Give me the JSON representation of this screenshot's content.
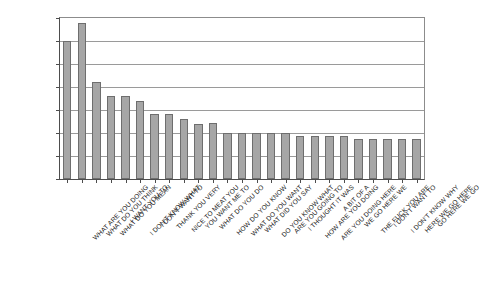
{
  "chart_data": {
    "type": "bar",
    "title": "",
    "subtitle": "",
    "xlabel": "",
    "ylabel": "",
    "ylim": [
      0,
      35
    ],
    "grid": true,
    "legend": false,
    "legend_position": "none",
    "bar_color": "#a6a6a6",
    "bar_border_color": "#6e6e6e",
    "axis_color": "#4d4d4d",
    "grid_color": "#9a9a9a",
    "ytick_labels": [
      "35",
      "30",
      "35",
      "20",
      "15",
      "10",
      "5",
      "0"
    ],
    "ytick_values": [
      35,
      30,
      25,
      20,
      15,
      10,
      5,
      0
    ],
    "categories": [
      "WHAT ARE YOU DOING",
      "WHAT DO YOU THINK",
      "WHAT DO YOU MEAN",
      "I WANT YOU TO",
      "I DON'T KNOW WHAT",
      "I DON'T WANT TO",
      "THANK YOU VERY",
      "NICE TO MEAT YOU",
      "YOU WANT ME TO",
      "WHAT DO YOU DO",
      "HOW DO YOU KNOW",
      "WHAT DO YOU WANT",
      "WHAT DID YOU SAY",
      "DO YOU KNOW WHAT",
      "ARE YOU GOING TO",
      "I THOUGHT IT WAS",
      "HOW ARE YOU DOING",
      "ARE YOU DOING HERE",
      "A BIT OF A",
      "WE GO HERE WE",
      "THE FUCK YOU ARE",
      "I DON'T WANT TO",
      "I DON'T KNOW WHY",
      "HERE WE GO HERE",
      "GO HERE WE GO"
    ],
    "values": [
      30,
      34,
      21,
      18,
      18,
      17,
      14.2,
      14.2,
      13,
      12,
      12.2,
      10,
      10,
      10,
      10,
      10,
      9.3,
      9.3,
      9.3,
      9.3,
      8.7,
      8.7,
      8.7,
      8.7,
      8.7
    ]
  }
}
